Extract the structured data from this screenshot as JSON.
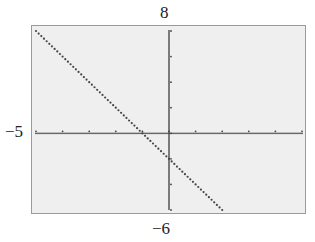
{
  "window": {
    "xmin": -5,
    "xmax": 5,
    "ymin": -6,
    "ymax": 8,
    "xscl": 1,
    "yscl": 2
  },
  "labels": {
    "ymax": "8",
    "ymin": "−6",
    "xmin": "−5"
  },
  "colors": {
    "screen": "#efefef",
    "border": "#9a9a9a",
    "plot": "#444444"
  },
  "chart_data": {
    "type": "line",
    "title": "",
    "xlabel": "",
    "ylabel": "",
    "xlim": [
      -5,
      5
    ],
    "ylim": [
      -6,
      8
    ],
    "grid": false,
    "series": [
      {
        "name": "y = -2x - 2",
        "x": [
          -5,
          -4,
          -3,
          -2,
          -1,
          0,
          1,
          2
        ],
        "values": [
          8,
          6,
          4,
          2,
          0,
          -2,
          -4,
          -6
        ]
      }
    ],
    "annotations": [
      "8",
      "−6",
      "−5"
    ]
  }
}
